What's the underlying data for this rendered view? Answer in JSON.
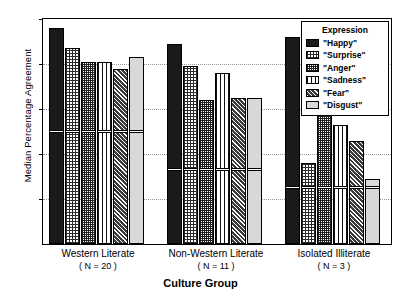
{
  "chart_data": {
    "type": "bar",
    "title": "",
    "xlabel": "Culture Group",
    "ylabel": "Median Percentage Agreement",
    "ylim": [
      0,
      100
    ],
    "yticks": [
      0,
      20,
      40,
      60,
      80,
      100
    ],
    "grid": true,
    "legend_position": "top-right",
    "legend_title": "Expression",
    "categories": [
      "Western Literate",
      "Non-Western Literate",
      "Isolated Illiterate"
    ],
    "category_sublabels": [
      "( N = 20 )",
      "( N = 11 )",
      "( N = 3 )"
    ],
    "series": [
      {
        "name": "\"Happy\"",
        "pattern": "solid-black",
        "values": [
          96,
          89,
          92
        ]
      },
      {
        "name": "\"Surprise\"",
        "pattern": "fine-dot-grid",
        "values": [
          87,
          79,
          36
        ]
      },
      {
        "name": "\"Anger\"",
        "pattern": "dense-crosshatch",
        "values": [
          81,
          64,
          58
        ]
      },
      {
        "name": "\"Sadness\"",
        "pattern": "vertical-lines",
        "values": [
          81,
          76,
          53
        ]
      },
      {
        "name": "\"Fear\"",
        "pattern": "diagonal-hatch",
        "values": [
          78,
          65,
          46
        ]
      },
      {
        "name": "\"Disgust\"",
        "pattern": "light-gray-solid",
        "values": [
          83,
          65,
          29
        ]
      }
    ],
    "reference_lines": {
      "description": "white horizontal chance-level markers drawn inside bars",
      "values_by_group": [
        50,
        33,
        25
      ]
    }
  },
  "ticks": {
    "t0": "0",
    "t20": "20",
    "t40": "40",
    "t60": "60",
    "t80": "80",
    "t100": "100"
  },
  "groups": [
    {
      "label": "Western Literate",
      "n": "( N = 20 )"
    },
    {
      "label": "Non-Western Literate",
      "n": "( N = 11 )"
    },
    {
      "label": "Isolated Illiterate",
      "n": "( N = 3 )"
    }
  ],
  "legend": {
    "title": "Expression",
    "items": [
      {
        "label": "\"Happy\""
      },
      {
        "label": "\"Surprise\""
      },
      {
        "label": "\"Anger\""
      },
      {
        "label": "\"Sadness\""
      },
      {
        "label": "\"Fear\""
      },
      {
        "label": "\"Disgust\""
      }
    ]
  },
  "axis": {
    "y_title": "Median Percentage Agreement",
    "x_title": "Culture Group"
  }
}
